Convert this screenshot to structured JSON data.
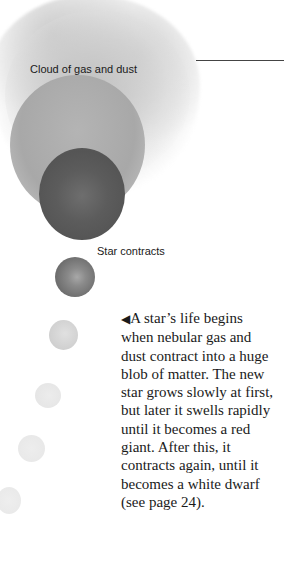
{
  "illustration": {
    "labels": {
      "cloud": "Cloud of gas and dust",
      "contracts": "Star contracts"
    }
  },
  "caption": {
    "pointer": "◀",
    "lines": [
      "A star’s life begins",
      "when nebular gas and",
      "dust contract into a huge",
      "blob of matter. The new",
      "star grows slowly at first,",
      "but later it swells rapidly",
      "until it becomes a red",
      "giant. After this, it",
      "contracts again, until it",
      "becomes a white dwarf",
      "(see page 24)."
    ]
  },
  "colors": {
    "text": "#1a1a1a",
    "line": "#444444",
    "background": "#ffffff"
  }
}
